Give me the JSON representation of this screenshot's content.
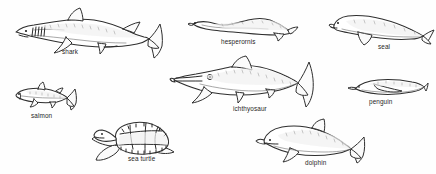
{
  "figure": {
    "kind": "scientific-line-illustration",
    "background_color": "#fefefe",
    "ink_color": "#2a2a2a",
    "label_color": "#1f1f1f",
    "specimen_count": 7
  },
  "specimens": [
    {
      "id": "shark",
      "label": "shark",
      "group": "cartilaginous fish",
      "label_x": 62,
      "label_y": 49,
      "box": {
        "x": 12,
        "y": 8,
        "w": 150,
        "h": 46
      },
      "features": "dorsal fin, heterocercal tail, five gill slits, pectoral fins"
    },
    {
      "id": "hesperornis",
      "label": "hesperornis",
      "group": "extinct flightless bird",
      "label_x": 221,
      "label_y": 39,
      "box": {
        "x": 190,
        "y": 14,
        "w": 106,
        "h": 24
      },
      "features": "long neck, elongate body, small hind flipper"
    },
    {
      "id": "seal",
      "label": "seal",
      "group": "marine mammal",
      "label_x": 378,
      "label_y": 44,
      "box": {
        "x": 330,
        "y": 14,
        "w": 100,
        "h": 30
      },
      "features": "blunt snout, fore-flipper, tapering hind flippers"
    },
    {
      "id": "salmon",
      "label": "salmon",
      "group": "bony fish",
      "label_x": 31,
      "label_y": 113,
      "box": {
        "x": 14,
        "y": 84,
        "w": 62,
        "h": 26
      },
      "features": "dorsal fin, adipose fin, forked caudal fin"
    },
    {
      "id": "ichthyosaur",
      "label": "ichthyosaur",
      "group": "extinct marine reptile",
      "label_x": 233,
      "label_y": 106,
      "box": {
        "x": 173,
        "y": 58,
        "w": 140,
        "h": 48
      },
      "features": "long rostrum, large eye, triangular dorsal fin, crescent tail"
    },
    {
      "id": "penguin",
      "label": "penguin",
      "group": "flightless bird",
      "label_x": 369,
      "label_y": 99,
      "box": {
        "x": 350,
        "y": 78,
        "w": 76,
        "h": 20
      },
      "features": "torpedo body, wing flipper, pointed beak"
    },
    {
      "id": "sea-turtle",
      "label": "sea turtle",
      "group": "marine reptile",
      "label_x": 128,
      "label_y": 156,
      "box": {
        "x": 92,
        "y": 118,
        "w": 84,
        "h": 44
      },
      "features": "scuted carapace, paddle fore-flippers, beaked head"
    },
    {
      "id": "dolphin",
      "label": "dolphin",
      "group": "marine mammal",
      "label_x": 305,
      "label_y": 160,
      "box": {
        "x": 258,
        "y": 120,
        "w": 104,
        "h": 42
      },
      "features": "melon head, falcate dorsal fin, horizontal fluke"
    }
  ]
}
